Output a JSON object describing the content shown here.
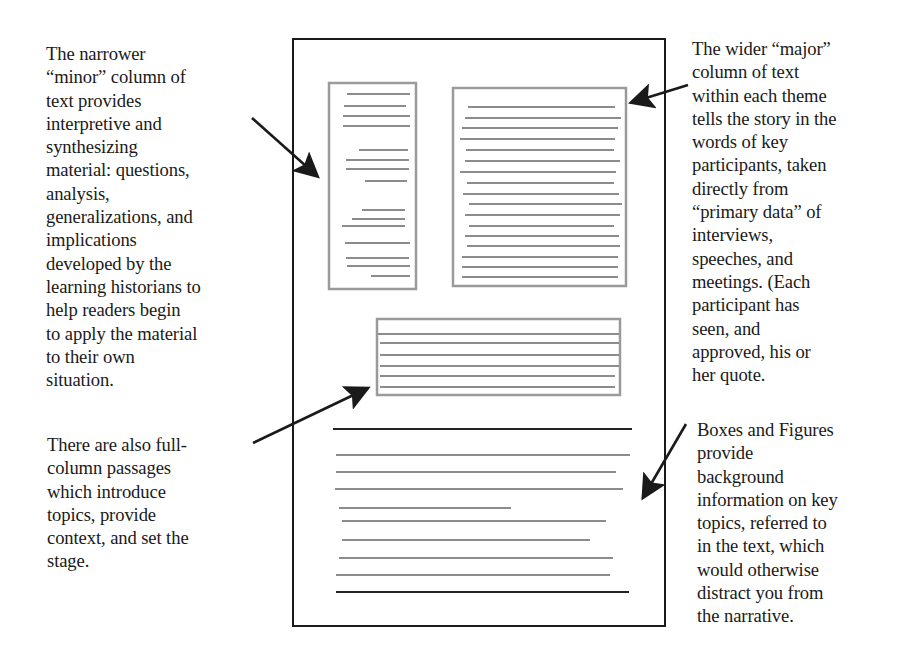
{
  "annotations": {
    "minor_column": "The narrower\n“minor” column of\ntext provides\ninterpretive and\nsynthesizing\nmaterial: questions,\nanalysis,\ngeneralizations, and\nimplications\ndeveloped by the\nlearning historians to\nhelp readers begin\nto apply the material\nto their own\nsituation.",
    "full_column": "There are also full-\ncolumn passages\nwhich introduce\ntopics, provide\ncontext, and set the\nstage.",
    "major_column": "The wider “major”\ncolumn of text\nwithin each theme\ntells the story in the\nwords of key\nparticipants, taken\ndirectly from\n“primary data” of\ninterviews,\nspeeches, and\nmeetings. (Each\nparticipant has\nseen, and\napproved, his or\nher quote.",
    "boxes_figures": "Boxes and Figures\nprovide\nbackground\ninformation on key\ntopics, referred to\nin the text, which\nwould otherwise\ndistract you from\nthe narrative."
  },
  "diagram": {
    "page_frame": {
      "x": 293,
      "y": 39,
      "width": 372,
      "height": 587
    },
    "minor_box": {
      "x": 329,
      "y": 83,
      "width": 87,
      "height": 206
    },
    "major_box": {
      "x": 453,
      "y": 88,
      "width": 173,
      "height": 198
    },
    "full_column_box": {
      "x": 377,
      "y": 319,
      "width": 243,
      "height": 76
    },
    "colors": {
      "frame": "#1a1a1a",
      "placeholder_box": "#9a9a9a",
      "placeholder_line": "#8c8c8c",
      "rule": "#222222",
      "arrow": "#1a1a1a"
    }
  }
}
